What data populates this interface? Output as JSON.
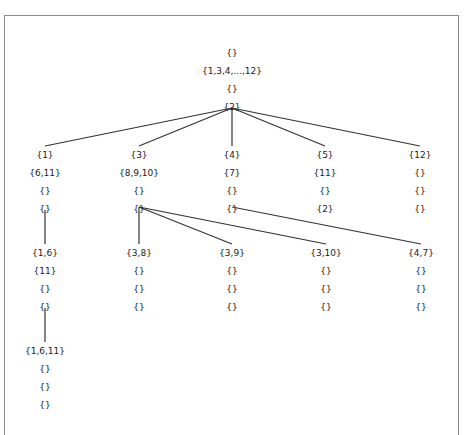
{
  "diagram": {
    "type": "tree",
    "nodes": {
      "root": {
        "rows": [
          "{}",
          "{1,3,4,...,12}",
          "{}",
          "{2}"
        ]
      },
      "n1": {
        "rows": [
          "{1}",
          "{6,11}",
          "{}",
          "{}"
        ]
      },
      "n3": {
        "rows": [
          "{3}",
          "{8,9,10}",
          "{}",
          "{}"
        ]
      },
      "n4": {
        "rows": [
          "{4}",
          "{7}",
          "{}",
          "{}"
        ]
      },
      "n5": {
        "rows": [
          "{5}",
          "{11}",
          "{}",
          "{2}"
        ]
      },
      "n12": {
        "rows": [
          "{12}",
          "{}",
          "{}",
          "{}"
        ]
      },
      "n16": {
        "rows": [
          "{1,6}",
          "{11}",
          "{}",
          "{}"
        ]
      },
      "n38": {
        "rows": [
          "{3,8}",
          "{}",
          "{}",
          "{}"
        ]
      },
      "n39": {
        "rows": [
          "{3,9}",
          "{}",
          "{}",
          "{}"
        ]
      },
      "n310": {
        "rows": [
          "{3,10}",
          "{}",
          "{}",
          "{}"
        ]
      },
      "n47": {
        "rows": [
          "{4,7}",
          "{}",
          "{}",
          "{}"
        ]
      },
      "n1611": {
        "rows": [
          "{1,6,11}",
          "{}",
          "{}",
          "{}"
        ]
      }
    },
    "edges": [
      [
        "root",
        "n1"
      ],
      [
        "root",
        "n3"
      ],
      [
        "root",
        "n4"
      ],
      [
        "root",
        "n5"
      ],
      [
        "root",
        "n12"
      ],
      [
        "n1",
        "n16"
      ],
      [
        "n16",
        "n1611"
      ],
      [
        "n3",
        "n38"
      ],
      [
        "n3",
        "n39"
      ],
      [
        "n3",
        "n310"
      ],
      [
        "n4",
        "n47"
      ]
    ],
    "colors": {
      "edge": "#333333",
      "text": "#222222",
      "frame": "#8a8a8a",
      "background": "#ffffff"
    }
  }
}
